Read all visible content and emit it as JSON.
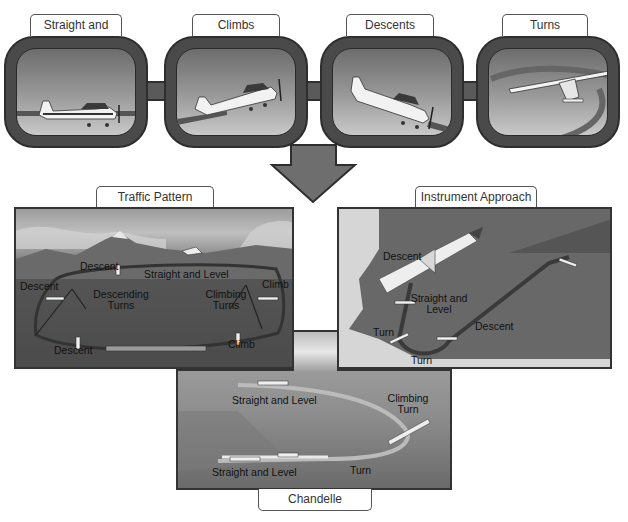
{
  "top_row": {
    "panels": [
      {
        "label": "Straight and Level",
        "icon": "airplane-level-icon"
      },
      {
        "label": "Climbs",
        "icon": "airplane-climb-icon"
      },
      {
        "label": "Descents",
        "icon": "airplane-descent-icon"
      },
      {
        "label": "Turns",
        "icon": "airplane-turn-icon"
      }
    ]
  },
  "arrow": {
    "icon": "down-arrow-icon",
    "color": "#6e6e6e"
  },
  "traffic_pattern": {
    "title": "Traffic Pattern",
    "labels": {
      "descent_top": "Descent",
      "straight_level": "Straight and Level",
      "descent_left": "Descent",
      "descending_turns": [
        "Descending",
        "Turns"
      ],
      "climbing_turns": [
        "Climbing",
        "Turns"
      ],
      "climb_right": "Climb",
      "descent_bottom": "Descent",
      "climb_bottom": "Climb"
    }
  },
  "instrument_approach": {
    "title": "Instrument Approach",
    "labels": {
      "descent_top": "Descent",
      "straight_level": [
        "Straight and",
        "Level"
      ],
      "turn_left": "Turn",
      "turn_bottom": "Turn",
      "descent_right": "Descent"
    }
  },
  "chandelle": {
    "title": "Chandelle",
    "labels": {
      "straight_level_top": "Straight and Level",
      "climbing_turn": [
        "Climbing",
        "Turn"
      ],
      "straight_level_bottom": "Straight and Level",
      "turn": "Turn"
    }
  },
  "colors": {
    "frame": "#4a4a4a",
    "frame_dark": "#2e2e2e",
    "scene_dark": "#4f4f4f",
    "sky_light": "#d0d0d0"
  }
}
